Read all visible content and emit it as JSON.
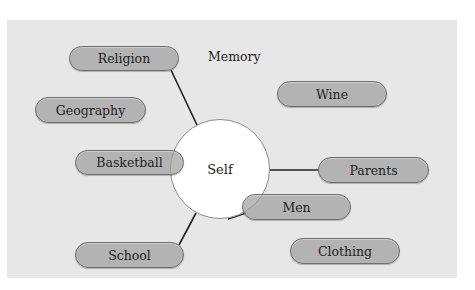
{
  "diagram": {
    "center": {
      "label": "Self",
      "cx": 220,
      "cy": 169,
      "r": 50
    },
    "free_label": {
      "label": "Memory",
      "x": 208,
      "y": 49
    },
    "nodes": [
      {
        "id": "religion",
        "label": "Religion",
        "x": 69,
        "y": 46,
        "w": 110,
        "h": 25,
        "connected": true
      },
      {
        "id": "geography",
        "label": "Geography",
        "x": 35,
        "y": 97,
        "w": 111,
        "h": 26,
        "connected": false
      },
      {
        "id": "basketball",
        "label": "Basketball",
        "x": 75,
        "y": 150,
        "w": 109,
        "h": 25,
        "connected": false
      },
      {
        "id": "school",
        "label": "School",
        "x": 75,
        "y": 242,
        "w": 109,
        "h": 26,
        "connected": true
      },
      {
        "id": "wine",
        "label": "Wine",
        "x": 277,
        "y": 81,
        "w": 110,
        "h": 26,
        "connected": false
      },
      {
        "id": "parents",
        "label": "Parents",
        "x": 318,
        "y": 157,
        "w": 111,
        "h": 26,
        "connected": true
      },
      {
        "id": "men",
        "label": "Men",
        "x": 242,
        "y": 194,
        "w": 109,
        "h": 26,
        "connected": true
      },
      {
        "id": "clothing",
        "label": "Clothing",
        "x": 290,
        "y": 238,
        "w": 110,
        "h": 26,
        "connected": false
      }
    ],
    "connectors": [
      {
        "from": "religion",
        "x1": 171,
        "y1": 70,
        "x2": 197,
        "y2": 125
      },
      {
        "from": "school",
        "x1": 179,
        "y1": 245,
        "x2": 196,
        "y2": 213
      },
      {
        "from": "parents",
        "x1": 270,
        "y1": 170,
        "x2": 318,
        "y2": 170
      },
      {
        "from": "men",
        "x1": 228,
        "y1": 219,
        "x2": 246,
        "y2": 213
      }
    ],
    "colors": {
      "background": "#ffffff",
      "panel": "#e7e7e7",
      "pill_fill": "#a0a0a0",
      "pill_border": "#6f6f6f",
      "circle_fill": "#ffffff",
      "circle_border": "#8a8a8a",
      "line": "#222222"
    }
  }
}
